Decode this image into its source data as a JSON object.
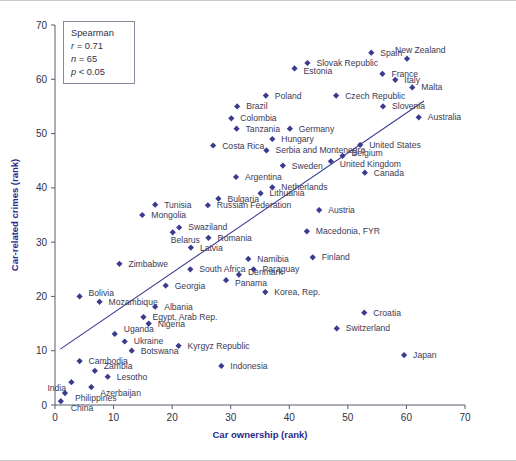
{
  "figure": {
    "title": "",
    "background_color": "#ffffff",
    "marker_color": "#3b3b8f",
    "axis_title_color": "#2a2a8c",
    "label_color": "#3a3a55"
  },
  "legend": {
    "name": "Spearman",
    "r_label": "r",
    "r_value": "= 0.71",
    "n_label": "n",
    "n_value": "= 65",
    "p_label": "p",
    "p_value": "< 0.05",
    "line1": "Spearman",
    "line2": "r = 0.71",
    "line3": "n = 65",
    "line4": "p < 0.05"
  },
  "chart_data": {
    "type": "scatter",
    "title": "",
    "subtitle": "",
    "xlabel": "Car ownership (rank)",
    "ylabel": "Car-related crimes (rank)",
    "xlim": [
      0,
      70
    ],
    "ylim": [
      0,
      70
    ],
    "xticks": [
      0,
      10,
      20,
      30,
      40,
      50,
      60,
      70
    ],
    "yticks": [
      0,
      10,
      20,
      30,
      40,
      50,
      60,
      70
    ],
    "grid": false,
    "legend_position": "top-left-inset",
    "annotations": {
      "statistic": "Spearman",
      "r": 0.71,
      "n": 65,
      "p": "< 0.05"
    },
    "trendline": {
      "type": "linear",
      "x_start": 0.9,
      "y_start": 10.3,
      "x_end": 63.0,
      "y_end": 56.0
    },
    "series": [
      {
        "name": "Countries",
        "marker": "diamond",
        "color": "#3b3b8f",
        "points": [
          {
            "label": "China",
            "x": 1.0,
            "y": 0.7,
            "lx": 10,
            "ly": 10
          },
          {
            "label": "Philippines",
            "x": 1.7,
            "y": 2.2,
            "lx": 10,
            "ly": 8
          },
          {
            "label": "India",
            "x": 2.8,
            "y": 4.2,
            "lx": -24,
            "ly": 9
          },
          {
            "label": "Azerbaijan",
            "x": 6.2,
            "y": 3.3,
            "lx": 9,
            "ly": 9
          },
          {
            "label": "Lesotho",
            "x": 9.0,
            "y": 5.2,
            "lx": 9,
            "ly": 3
          },
          {
            "label": "Zambia",
            "x": 6.8,
            "y": 6.3,
            "lx": 9,
            "ly": -2
          },
          {
            "label": "Cambodia",
            "x": 4.2,
            "y": 8.1,
            "lx": 9,
            "ly": 3
          },
          {
            "label": "Botswana",
            "x": 13.1,
            "y": 10.0,
            "lx": 9,
            "ly": 3
          },
          {
            "label": "Ukraine",
            "x": 11.9,
            "y": 11.7,
            "lx": 9,
            "ly": 3
          },
          {
            "label": "Uganda",
            "x": 10.2,
            "y": 13.1,
            "lx": 9,
            "ly": -2
          },
          {
            "label": "Kyrgyz Republic",
            "x": 21.1,
            "y": 10.9,
            "lx": 9,
            "ly": 3
          },
          {
            "label": "Indonesia",
            "x": 28.4,
            "y": 7.2,
            "lx": 9,
            "ly": 3
          },
          {
            "label": "Nigeria",
            "x": 16.0,
            "y": 15.0,
            "lx": 9,
            "ly": 3
          },
          {
            "label": "Egypt, Arab Rep.",
            "x": 15.1,
            "y": 16.2,
            "lx": 9,
            "ly": 3
          },
          {
            "label": "Albania",
            "x": 17.1,
            "y": 18.1,
            "lx": 9,
            "ly": 3
          },
          {
            "label": "Mozambique",
            "x": 7.6,
            "y": 19.0,
            "lx": 9,
            "ly": 3
          },
          {
            "label": "Bolivia",
            "x": 4.2,
            "y": 20.0,
            "lx": 9,
            "ly": 0
          },
          {
            "label": "Georgia",
            "x": 18.9,
            "y": 22.0,
            "lx": 9,
            "ly": 3
          },
          {
            "label": "Zimbabwe",
            "x": 11.0,
            "y": 26.0,
            "lx": 9,
            "ly": 3
          },
          {
            "label": "Panama",
            "x": 29.2,
            "y": 23.0,
            "lx": 9,
            "ly": 6
          },
          {
            "label": "Denmark",
            "x": 31.4,
            "y": 24.0,
            "lx": 9,
            "ly": 0
          },
          {
            "label": "South Africa",
            "x": 23.1,
            "y": 25.0,
            "lx": 9,
            "ly": 3
          },
          {
            "label": "Latvia",
            "x": 23.2,
            "y": 29.0,
            "lx": 9,
            "ly": 3
          },
          {
            "label": "Romania",
            "x": 26.2,
            "y": 30.8,
            "lx": 9,
            "ly": 3
          },
          {
            "label": "Belarus",
            "x": 20.1,
            "y": 31.8,
            "lx": -2,
            "ly": 11
          },
          {
            "label": "Swaziland",
            "x": 21.2,
            "y": 32.7,
            "lx": 9,
            "ly": 3
          },
          {
            "label": "Mongolia",
            "x": 14.9,
            "y": 35.0,
            "lx": 9,
            "ly": 3
          },
          {
            "label": "Tunisia",
            "x": 17.1,
            "y": 36.9,
            "lx": 9,
            "ly": 3
          },
          {
            "label": "Russian Federation",
            "x": 26.1,
            "y": 36.8,
            "lx": 9,
            "ly": 3
          },
          {
            "label": "Namibia",
            "x": 33.0,
            "y": 26.9,
            "lx": 9,
            "ly": 3
          },
          {
            "label": "Paraguay",
            "x": 33.9,
            "y": 25.0,
            "lx": 9,
            "ly": 3
          },
          {
            "label": "Finland",
            "x": 44.0,
            "y": 27.2,
            "lx": 9,
            "ly": 3
          },
          {
            "label": "Korea, Rep.",
            "x": 35.9,
            "y": 20.8,
            "lx": 9,
            "ly": 3
          },
          {
            "label": "Croatia",
            "x": 52.8,
            "y": 17.0,
            "lx": 9,
            "ly": 3
          },
          {
            "label": "Switzerland",
            "x": 48.1,
            "y": 14.1,
            "lx": 9,
            "ly": 3
          },
          {
            "label": "Japan",
            "x": 59.6,
            "y": 9.2,
            "lx": 9,
            "ly": 3
          },
          {
            "label": "Macedonia, FYR",
            "x": 43.0,
            "y": 32.0,
            "lx": 9,
            "ly": 3
          },
          {
            "label": "Austria",
            "x": 45.1,
            "y": 35.9,
            "lx": 9,
            "ly": 3
          },
          {
            "label": "Bulgaria",
            "x": 27.9,
            "y": 38.0,
            "lx": 9,
            "ly": 3
          },
          {
            "label": "Lithuania",
            "x": 35.1,
            "y": 39.0,
            "lx": 9,
            "ly": 3
          },
          {
            "label": "Netherlands",
            "x": 37.1,
            "y": 40.1,
            "lx": 9,
            "ly": 3
          },
          {
            "label": "Argentina",
            "x": 30.9,
            "y": 42.0,
            "lx": 9,
            "ly": 3
          },
          {
            "label": "Sweden",
            "x": 38.9,
            "y": 44.1,
            "lx": 9,
            "ly": 3
          },
          {
            "label": "United Kingdom",
            "x": 47.1,
            "y": 44.9,
            "lx": 9,
            "ly": 6
          },
          {
            "label": "Belgium",
            "x": 49.1,
            "y": 45.9,
            "lx": 9,
            "ly": 0
          },
          {
            "label": "Canada",
            "x": 52.9,
            "y": 42.8,
            "lx": 9,
            "ly": 3
          },
          {
            "label": "United States",
            "x": 52.1,
            "y": 47.9,
            "lx": 9,
            "ly": 3
          },
          {
            "label": "Serbia and Montenegro",
            "x": 36.1,
            "y": 46.9,
            "lx": 9,
            "ly": 3
          },
          {
            "label": "Hungary",
            "x": 37.1,
            "y": 49.0,
            "lx": 9,
            "ly": 3
          },
          {
            "label": "Germany",
            "x": 40.1,
            "y": 50.9,
            "lx": 9,
            "ly": 3
          },
          {
            "label": "Costa Rica",
            "x": 27.0,
            "y": 47.8,
            "lx": 9,
            "ly": 3
          },
          {
            "label": "Tanzania",
            "x": 31.0,
            "y": 50.9,
            "lx": 9,
            "ly": 3
          },
          {
            "label": "Colombia",
            "x": 30.1,
            "y": 52.8,
            "lx": 9,
            "ly": 3
          },
          {
            "label": "Brazil",
            "x": 31.1,
            "y": 55.0,
            "lx": 9,
            "ly": 3
          },
          {
            "label": "Poland",
            "x": 36.0,
            "y": 57.0,
            "lx": 9,
            "ly": 3
          },
          {
            "label": "Estonia",
            "x": 40.9,
            "y": 62.0,
            "lx": 9,
            "ly": 6
          },
          {
            "label": "Slovak Republic",
            "x": 43.1,
            "y": 63.0,
            "lx": 9,
            "ly": 3
          },
          {
            "label": "Czech Republic",
            "x": 48.0,
            "y": 57.0,
            "lx": 9,
            "ly": 3
          },
          {
            "label": "Spain",
            "x": 54.0,
            "y": 64.9,
            "lx": 9,
            "ly": 3
          },
          {
            "label": "New Zealand",
            "x": 60.1,
            "y": 63.8,
            "lx": -12,
            "ly": -6
          },
          {
            "label": "France",
            "x": 55.9,
            "y": 61.0,
            "lx": 9,
            "ly": 3
          },
          {
            "label": "Italy",
            "x": 58.1,
            "y": 59.9,
            "lx": 9,
            "ly": 3
          },
          {
            "label": "Malta",
            "x": 61.0,
            "y": 58.5,
            "lx": 9,
            "ly": 3
          },
          {
            "label": "Slovenia",
            "x": 56.0,
            "y": 55.0,
            "lx": 9,
            "ly": 3
          },
          {
            "label": "Australia",
            "x": 62.1,
            "y": 53.0,
            "lx": 9,
            "ly": 3
          }
        ]
      }
    ]
  }
}
